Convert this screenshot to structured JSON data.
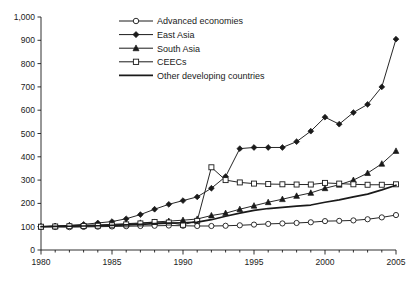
{
  "chart_data": {
    "type": "line",
    "title": "",
    "xlabel": "",
    "ylabel": "",
    "xlim": [
      1980,
      2005
    ],
    "ylim": [
      0,
      1000
    ],
    "ytick_labels": [
      "0",
      "100",
      "200",
      "300",
      "400",
      "500",
      "600",
      "700",
      "800",
      "900",
      "1,000"
    ],
    "ytick_values": [
      0,
      100,
      200,
      300,
      400,
      500,
      600,
      700,
      800,
      900,
      1000
    ],
    "xtick_labels": [
      "1980",
      "1985",
      "1990",
      "1995",
      "2000",
      "2005"
    ],
    "xtick_values": [
      1980,
      1985,
      1990,
      1995,
      2000,
      2005
    ],
    "minor_xticks": [
      1981,
      1982,
      1983,
      1984,
      1986,
      1987,
      1988,
      1989,
      1991,
      1992,
      1993,
      1994,
      1996,
      1997,
      1998,
      1999,
      2001,
      2002,
      2003,
      2004
    ],
    "grid": false,
    "legend_position": "top-center",
    "x": [
      1980,
      1981,
      1982,
      1983,
      1984,
      1985,
      1986,
      1987,
      1988,
      1989,
      1990,
      1991,
      1992,
      1993,
      1994,
      1995,
      1996,
      1997,
      1998,
      1999,
      2000,
      2001,
      2002,
      2003,
      2004,
      2005
    ],
    "series": [
      {
        "name": "Advanced economies",
        "marker": "open-circle",
        "values": [
          100,
          99,
          98,
          99,
          100,
          101,
          102,
          103,
          104,
          105,
          104,
          103,
          103,
          104,
          106,
          109,
          112,
          114,
          116,
          119,
          124,
          125,
          127,
          132,
          140,
          150
        ]
      },
      {
        "name": "East Asia",
        "marker": "filled-diamond",
        "values": [
          100,
          103,
          106,
          110,
          116,
          122,
          134,
          152,
          175,
          196,
          212,
          228,
          265,
          315,
          435,
          440,
          440,
          440,
          465,
          510,
          570,
          540,
          590,
          625,
          700,
          905
        ]
      },
      {
        "name": "South Asia",
        "marker": "filled-triangle",
        "values": [
          100,
          102,
          104,
          106,
          108,
          110,
          113,
          116,
          120,
          124,
          128,
          133,
          148,
          158,
          175,
          190,
          205,
          218,
          232,
          245,
          265,
          280,
          300,
          330,
          370,
          425
        ]
      },
      {
        "name": "CEECs",
        "marker": "open-square",
        "values": [
          100,
          101,
          102,
          103,
          104,
          106,
          110,
          114,
          120,
          118,
          108,
          125,
          355,
          300,
          290,
          285,
          283,
          282,
          281,
          281,
          288,
          285,
          282,
          280,
          280,
          282
        ]
      },
      {
        "name": "Other developing countries",
        "marker": "none",
        "values": [
          100,
          101,
          102,
          103,
          104,
          106,
          108,
          110,
          113,
          115,
          117,
          120,
          130,
          145,
          158,
          170,
          178,
          183,
          188,
          193,
          205,
          215,
          228,
          240,
          258,
          278
        ]
      }
    ]
  }
}
